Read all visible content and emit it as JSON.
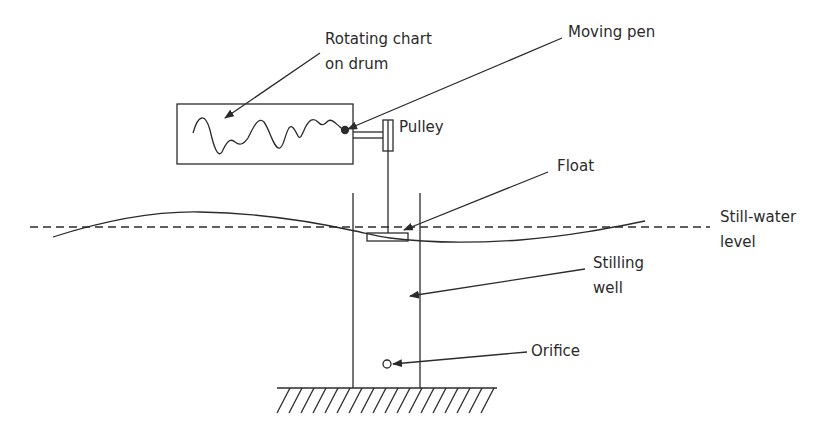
{
  "diagram": {
    "labels": {
      "rotating_chart_line1": "Rotating chart",
      "rotating_chart_line2": "on drum",
      "moving_pen": "Moving pen",
      "pulley": "Pulley",
      "float": "Float",
      "still_water_line1": "Still-water",
      "still_water_line2": "level",
      "stilling_well_line1": "Stilling",
      "stilling_well_line2": "well",
      "orifice": "Orifice"
    },
    "components": [
      "rotating chart drum",
      "moving pen",
      "pulley",
      "float rod",
      "float",
      "stilling well",
      "orifice",
      "ground (seabed)",
      "water surface wave",
      "still-water level (dashed)"
    ],
    "colors": {
      "line": "#2b2b2b",
      "background": "#ffffff"
    }
  }
}
